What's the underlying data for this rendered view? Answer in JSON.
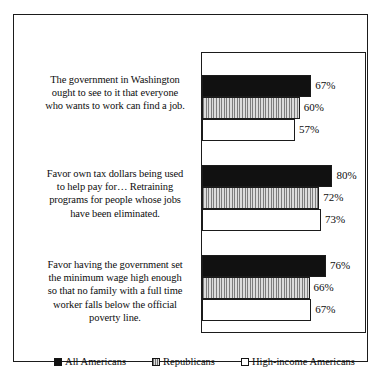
{
  "chart_data": {
    "type": "bar",
    "orientation": "horizontal",
    "title": "",
    "subtitle": "",
    "xlabel": "",
    "ylabel": "",
    "xlim": [
      0,
      100
    ],
    "grid": false,
    "legend_position": "bottom",
    "value_suffix": "%",
    "categories": [
      "The government in Washington ought to see to it that everyone who wants to work can find a job.",
      "Favor own tax dollars being used to help pay for… Retraining programs for people whose jobs have been eliminated.",
      "Favor having the government set the minimum wage high enough so that no family with a full time worker falls below the official poverty line."
    ],
    "series": [
      {
        "name": "All Americans",
        "key": "series-all",
        "color": "#111111",
        "fill": "solid-black",
        "values": [
          67,
          60,
          57
        ],
        "labels": [
          "67%",
          "60%",
          "57%"
        ]
      },
      {
        "name": "Republicans",
        "key": "series-rep",
        "color": "#c8c8c8",
        "fill": "vertical-stripes-gray",
        "values": [
          72,
          72,
          66
        ],
        "labels": [
          "72%",
          "72%",
          "66%"
        ]
      },
      {
        "name": "High-income Americans",
        "key": "series-high",
        "color": "#ffffff",
        "fill": "hollow-white",
        "values": [
          57,
          73,
          67
        ],
        "labels": [
          "57%",
          "73%",
          "67%"
        ]
      }
    ],
    "groups": [
      {
        "label_lines": [
          "The government in Washington",
          "ought to see to it that everyone",
          "who wants to work can find a job."
        ],
        "bars": [
          {
            "series": "All Americans",
            "key": "series-all",
            "value": 67,
            "label": "67%"
          },
          {
            "series": "Republicans",
            "key": "series-rep",
            "value": 60,
            "label": "60%"
          },
          {
            "series": "High-income Americans",
            "key": "series-high",
            "value": 57,
            "label": "57%"
          }
        ]
      },
      {
        "label_lines": [
          "Favor own tax dollars being used",
          "to help pay for… Retraining",
          "programs for people whose jobs",
          "have been eliminated."
        ],
        "bars": [
          {
            "series": "All Americans",
            "key": "series-all",
            "value": 80,
            "label": "80%"
          },
          {
            "series": "Republicans",
            "key": "series-rep",
            "value": 72,
            "label": "72%"
          },
          {
            "series": "High-income Americans",
            "key": "series-high",
            "value": 73,
            "label": "73%"
          }
        ]
      },
      {
        "label_lines": [
          "Favor having the government set",
          "the minimum wage high enough",
          "so that no family with a full time",
          "worker falls below the official",
          "poverty line."
        ],
        "bars": [
          {
            "series": "All Americans",
            "key": "series-all",
            "value": 76,
            "label": "76%"
          },
          {
            "series": "Republicans",
            "key": "series-rep",
            "value": 66,
            "label": "66%"
          },
          {
            "series": "High-income Americans",
            "key": "series-high",
            "value": 67,
            "label": "67%"
          }
        ]
      }
    ]
  },
  "questions": [
    {
      "text": "The government in Washington ought to see to it that everyone who wants to work can find a job.",
      "line1": "The government in Washington",
      "line2": "ought to see to it that everyone",
      "line3": "who wants to work can find a job.",
      "line4": "",
      "line5": ""
    },
    {
      "text": "Favor own tax dollars being used to help pay for… Retraining programs for people whose jobs have been eliminated.",
      "line1": "Favor own tax dollars being used",
      "line2": "to help pay for… Retraining",
      "line3": "programs for people whose jobs",
      "line4": "have been eliminated.",
      "line5": ""
    },
    {
      "text": "Favor having the government set the minimum wage high enough so that no family with a full time worker falls below the official poverty line.",
      "line1": "Favor having the government set",
      "line2": "the minimum wage high enough",
      "line3": "so that no family with a full time",
      "line4": "worker falls below the official",
      "line5": "poverty line."
    }
  ],
  "bars": {
    "g0": {
      "b0": {
        "label": "67%",
        "width_pct": "67%"
      },
      "b1": {
        "label": "60%",
        "width_pct": "60%"
      },
      "b2": {
        "label": "57%",
        "width_pct": "57%"
      }
    },
    "g1": {
      "b0": {
        "label": "80%",
        "width_pct": "80%"
      },
      "b1": {
        "label": "72%",
        "width_pct": "72%"
      },
      "b2": {
        "label": "73%",
        "width_pct": "73%"
      }
    },
    "g2": {
      "b0": {
        "label": "76%",
        "width_pct": "76%"
      },
      "b1": {
        "label": "66%",
        "width_pct": "66%"
      },
      "b2": {
        "label": "67%",
        "width_pct": "67%"
      }
    }
  },
  "legend": {
    "items": [
      {
        "label": "All Americans",
        "swatch": "solid-black-square-icon"
      },
      {
        "label": "Republicans",
        "swatch": "striped-gray-square-icon"
      },
      {
        "label": "High-income Americans",
        "swatch": "hollow-white-square-icon"
      }
    ]
  },
  "colors": {
    "all_americans": "#111111",
    "republicans": "#c8c8c8",
    "high_income_americans": "#ffffff",
    "frame": "#1b1b1b",
    "background": "#ffffff",
    "text": "#0d0d0d"
  }
}
